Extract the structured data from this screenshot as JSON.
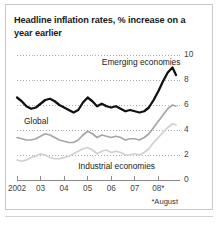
{
  "figure": {
    "title": "Headline inflation rates, % increase on a year earlier",
    "footnote": "*August"
  },
  "chart_data": {
    "type": "line",
    "title": "Headline inflation rates, % increase on a year earlier",
    "xlabel": "",
    "ylabel": "",
    "ylim": [
      0,
      10
    ],
    "yticks": [
      0,
      2,
      4,
      6,
      8,
      10
    ],
    "ytick_labels": [
      "0",
      "2",
      "4",
      "6",
      "8",
      "10"
    ],
    "y_axis_position": "right",
    "xlim": [
      2002.0,
      2008.75
    ],
    "xticks": [
      2002,
      2003,
      2004,
      2005,
      2006,
      2007,
      2008
    ],
    "xtick_labels": [
      "2002",
      "03",
      "04",
      "05",
      "06",
      "07",
      "08*"
    ],
    "grid": "horizontal-dotted",
    "legend": "inline-annotations",
    "annotations": [
      {
        "text": "Emerging economies",
        "x": 2005.6,
        "y": 9.35
      },
      {
        "text": "Global",
        "x": 2002.3,
        "y": 4.65
      },
      {
        "text": "Industrial economies",
        "x": 2004.6,
        "y": 1.05
      }
    ],
    "series": [
      {
        "name": "Emerging economies",
        "color": "#111111",
        "x": [
          2002.0,
          2002.2,
          2002.4,
          2002.6,
          2002.8,
          2003.0,
          2003.2,
          2003.4,
          2003.6,
          2003.8,
          2004.0,
          2004.2,
          2004.4,
          2004.6,
          2004.8,
          2005.0,
          2005.2,
          2005.4,
          2005.6,
          2005.8,
          2006.0,
          2006.2,
          2006.4,
          2006.6,
          2006.8,
          2007.0,
          2007.2,
          2007.4,
          2007.6,
          2007.8,
          2008.0,
          2008.2,
          2008.4,
          2008.6,
          2008.75
        ],
        "values": [
          6.6,
          6.3,
          5.9,
          5.7,
          5.8,
          6.1,
          6.4,
          6.5,
          6.3,
          6.0,
          5.8,
          5.6,
          5.4,
          5.6,
          6.2,
          6.6,
          6.3,
          5.9,
          6.1,
          5.9,
          5.8,
          5.9,
          5.7,
          5.5,
          5.6,
          5.5,
          5.4,
          5.5,
          5.8,
          6.4,
          7.1,
          7.9,
          8.6,
          9.0,
          8.4
        ]
      },
      {
        "name": "Global",
        "color": "#a6a6a6",
        "x": [
          2002.0,
          2002.2,
          2002.4,
          2002.6,
          2002.8,
          2003.0,
          2003.2,
          2003.4,
          2003.6,
          2003.8,
          2004.0,
          2004.2,
          2004.4,
          2004.6,
          2004.8,
          2005.0,
          2005.2,
          2005.4,
          2005.6,
          2005.8,
          2006.0,
          2006.2,
          2006.4,
          2006.6,
          2006.8,
          2007.0,
          2007.2,
          2007.4,
          2007.6,
          2007.8,
          2008.0,
          2008.2,
          2008.4,
          2008.6,
          2008.75
        ],
        "values": [
          3.4,
          3.3,
          3.2,
          3.2,
          3.3,
          3.5,
          3.7,
          3.6,
          3.4,
          3.2,
          3.1,
          3.0,
          3.0,
          3.2,
          3.6,
          3.9,
          3.7,
          3.4,
          3.6,
          3.5,
          3.4,
          3.5,
          3.4,
          3.2,
          3.3,
          3.3,
          3.2,
          3.4,
          3.7,
          4.2,
          4.7,
          5.2,
          5.7,
          6.0,
          5.9
        ]
      },
      {
        "name": "Industrial economies",
        "color": "#d0d0d0",
        "x": [
          2002.0,
          2002.2,
          2002.4,
          2002.6,
          2002.8,
          2003.0,
          2003.2,
          2003.4,
          2003.6,
          2003.8,
          2004.0,
          2004.2,
          2004.4,
          2004.6,
          2004.8,
          2005.0,
          2005.2,
          2005.4,
          2005.6,
          2005.8,
          2006.0,
          2006.2,
          2006.4,
          2006.6,
          2006.8,
          2007.0,
          2007.2,
          2007.4,
          2007.6,
          2007.8,
          2008.0,
          2008.2,
          2008.4,
          2008.6,
          2008.75
        ],
        "values": [
          1.6,
          1.5,
          1.6,
          1.8,
          1.9,
          2.1,
          2.0,
          1.8,
          1.7,
          1.7,
          1.8,
          1.9,
          2.1,
          2.3,
          2.5,
          2.6,
          2.4,
          2.1,
          2.3,
          2.4,
          2.2,
          2.3,
          2.2,
          2.0,
          2.0,
          2.1,
          2.0,
          2.2,
          2.5,
          3.0,
          3.4,
          3.8,
          4.2,
          4.5,
          4.4
        ]
      }
    ]
  }
}
